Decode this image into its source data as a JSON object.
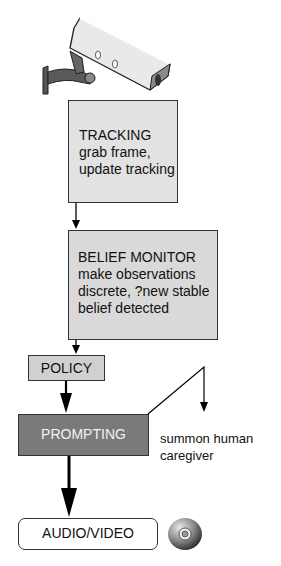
{
  "diagram": {
    "nodes": [
      {
        "id": "camera",
        "type": "icon",
        "icon": "security-camera-icon"
      },
      {
        "id": "tracking",
        "title": "TRACKING",
        "lines": [
          "grab frame,",
          "update tracking"
        ],
        "fill": "#e2e2e2"
      },
      {
        "id": "belief_monitor",
        "title": "BELIEF MONITOR",
        "lines": [
          "make observations",
          "discrete, ?new stable",
          "belief detected"
        ],
        "fill": "#d9d9d9"
      },
      {
        "id": "policy",
        "title": "POLICY",
        "fill": "#d0d0d0"
      },
      {
        "id": "prompting",
        "title": "PROMPTING",
        "fill": "#7a7a7a",
        "text_color": "#f2f2f2"
      },
      {
        "id": "caregiver",
        "text_lines": [
          "summon human",
          "caregiver"
        ]
      },
      {
        "id": "audio_video",
        "title": "AUDIO/VIDEO",
        "fill": "#ffffff"
      },
      {
        "id": "disc",
        "type": "icon",
        "icon": "cd-disc-icon"
      }
    ],
    "edges": [
      {
        "from": "tracking",
        "to": "belief_monitor"
      },
      {
        "from": "belief_monitor",
        "to": "policy"
      },
      {
        "from": "policy",
        "to": "prompting"
      },
      {
        "from": "prompting",
        "to": "caregiver"
      },
      {
        "from": "prompting",
        "to": "audio_video"
      }
    ]
  }
}
